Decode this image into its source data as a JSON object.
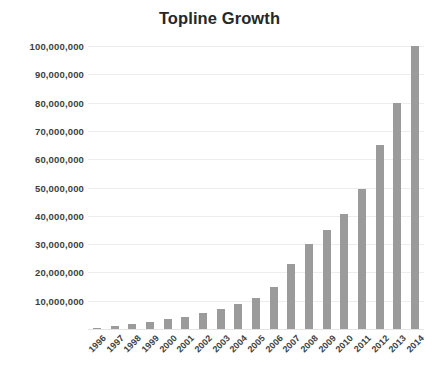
{
  "chart_data": {
    "type": "bar",
    "title": "Topline Growth",
    "xlabel": "",
    "ylabel": "",
    "grid": "horizontal",
    "legend": "none",
    "ylim": [
      0,
      100000000
    ],
    "ytick_labels": [
      "100,000,000",
      "90,000,000",
      "80,000,000",
      "70,000,000",
      "60,000,000",
      "50,000,000",
      "40,000,000",
      "30,000,000",
      "20,000,000",
      "10,000,000"
    ],
    "ytick_values": [
      100000000,
      90000000,
      80000000,
      70000000,
      60000000,
      50000000,
      40000000,
      30000000,
      20000000,
      10000000
    ],
    "categories": [
      "1996",
      "1997",
      "1998",
      "1999",
      "2000",
      "2001",
      "2002",
      "2003",
      "2004",
      "2005",
      "2006",
      "2007",
      "2008",
      "2009",
      "2010",
      "2011",
      "2012",
      "2013",
      "2014"
    ],
    "values": [
      400000,
      900000,
      1800000,
      2600000,
      3400000,
      4200000,
      5500000,
      7000000,
      8700000,
      11000000,
      15000000,
      23000000,
      30000000,
      35000000,
      40500000,
      49500000,
      65000000,
      80000000,
      100000000
    ],
    "bar_color": "#9b9b9b",
    "gridline_color": "#ededed",
    "title_color": "#25282a",
    "tick_label_color": "#3c3f41",
    "background_color": "#ffffff"
  }
}
